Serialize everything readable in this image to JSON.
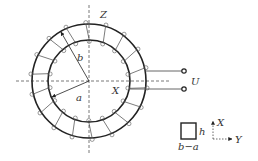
{
  "figure": {
    "labels": {
      "z_axis": "Z",
      "outer_radius": "b",
      "inner_radius": "a",
      "x_axis": "X",
      "voltage": "U",
      "cross_section_height": "h",
      "cross_section_width": "b−a",
      "inset_x": "X",
      "inset_y": "Y"
    },
    "colors": {
      "stroke": "#222222",
      "dash": "#555555",
      "winding": "#444444",
      "background": "#ffffff"
    },
    "geometry": {
      "center": [
        89,
        81
      ],
      "outer_r": 57,
      "inner_r": 41,
      "winding_count": 18
    }
  }
}
